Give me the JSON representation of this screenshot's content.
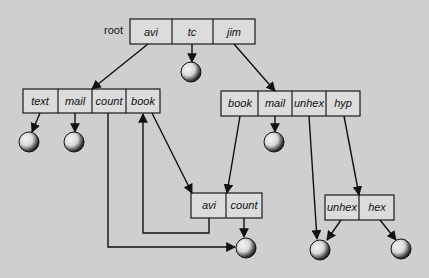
{
  "diagram": {
    "type": "directory-structure-graph",
    "root_label": "root",
    "nodes": {
      "root": {
        "cells": [
          "avi",
          "tc",
          "jim"
        ]
      },
      "avi_dir": {
        "cells": [
          "text",
          "mail",
          "count",
          "book"
        ]
      },
      "jim_dir": {
        "cells": [
          "book",
          "mail",
          "unhex",
          "hyp"
        ]
      },
      "book_dir": {
        "cells": [
          "avi",
          "count"
        ]
      },
      "hyp_dir": {
        "cells": [
          "unhex",
          "hex"
        ]
      }
    },
    "leaf_files": [
      "tc-file",
      "text-file",
      "mail-file-avi",
      "mail-file-jim",
      "count-file",
      "unhex-file",
      "hex-file"
    ],
    "edges": [
      {
        "from": "root.avi",
        "to": "avi_dir"
      },
      {
        "from": "root.tc",
        "to": "tc-file"
      },
      {
        "from": "root.jim",
        "to": "jim_dir"
      },
      {
        "from": "avi_dir.text",
        "to": "text-file"
      },
      {
        "from": "avi_dir.mail",
        "to": "mail-file-avi"
      },
      {
        "from": "avi_dir.count",
        "to": "count-file"
      },
      {
        "from": "avi_dir.book",
        "to": "book_dir"
      },
      {
        "from": "jim_dir.book",
        "to": "book_dir"
      },
      {
        "from": "jim_dir.mail",
        "to": "mail-file-jim"
      },
      {
        "from": "jim_dir.unhex",
        "to": "unhex-file"
      },
      {
        "from": "jim_dir.hyp",
        "to": "hyp_dir"
      },
      {
        "from": "book_dir.avi",
        "to": "avi_dir.book"
      },
      {
        "from": "book_dir.count",
        "to": "count-file"
      },
      {
        "from": "hyp_dir.unhex",
        "to": "unhex-file"
      },
      {
        "from": "hyp_dir.hex",
        "to": "hex-file"
      }
    ]
  },
  "colors": {
    "background": "#cfcfcf",
    "box_fill": "#dcdcdc",
    "stroke": "#111111"
  }
}
